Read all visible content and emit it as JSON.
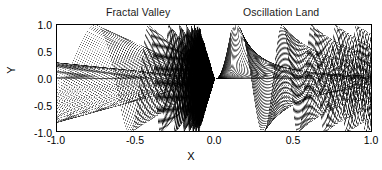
{
  "chart_data": {
    "type": "line",
    "title": "",
    "titles": [
      "Fractal Valley",
      "Oscillation Land"
    ],
    "xlabel": "X",
    "ylabel": "Y",
    "xlim": [
      -1.0,
      1.0
    ],
    "ylim": [
      -1.0,
      1.0
    ],
    "xticks": [
      "-1.0",
      "-0.5",
      "0.0",
      "0.5",
      "1.0"
    ],
    "xtick_values": [
      -1.0,
      -0.5,
      0.0,
      0.5,
      1.0
    ],
    "yticks": [
      "1.0",
      "0.5",
      "0.0",
      "-0.5",
      "-1.0"
    ],
    "ytick_values": [
      1.0,
      0.5,
      0.0,
      -0.5,
      -1.0
    ],
    "grid": false,
    "legend": "none",
    "line_color": "#000000",
    "background": "#ffffff",
    "series_count": 60,
    "series": [
      {
        "name": "chirp-01",
        "amplitude": 1.0,
        "freq": 0.04
      },
      {
        "name": "chirp-02",
        "amplitude": 1.0,
        "freq": 0.08
      },
      {
        "name": "chirp-03",
        "amplitude": 1.0,
        "freq": 0.12
      },
      {
        "name": "chirp-04",
        "amplitude": 1.0,
        "freq": 0.16
      },
      {
        "name": "chirp-05",
        "amplitude": 1.0,
        "freq": 0.2
      },
      {
        "name": "chirp-06",
        "amplitude": 1.0,
        "freq": 0.24
      },
      {
        "name": "chirp-07",
        "amplitude": 1.0,
        "freq": 0.28
      },
      {
        "name": "chirp-08",
        "amplitude": 1.0,
        "freq": 0.32
      },
      {
        "name": "chirp-09",
        "amplitude": 1.0,
        "freq": 0.36
      },
      {
        "name": "chirp-10",
        "amplitude": 1.0,
        "freq": 0.4
      }
    ]
  },
  "chart": {
    "title_left": "Fractal Valley",
    "title_right": "Oscillation Land",
    "xlabel": "X",
    "ylabel": "Y",
    "xticks": [
      "-1.0",
      "-0.5",
      "0.0",
      "0.5",
      "1.0"
    ],
    "yticks": [
      "1.0",
      "0.5",
      "0.0",
      "-0.5",
      "-1.0"
    ]
  }
}
